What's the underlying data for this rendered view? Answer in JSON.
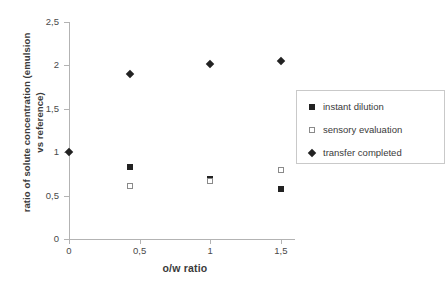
{
  "chart_data": {
    "type": "scatter",
    "title": "",
    "xlabel": "o/w ratio",
    "ylabel": "ratio of solute concentration (emulsion vs reference)",
    "ylabel_line1": "ratio of solute concentration (emulsion",
    "ylabel_line2": "vs reference)",
    "xlim": [
      0,
      1.6
    ],
    "ylim": [
      0,
      2.5
    ],
    "grid": false,
    "legend_position": "right",
    "xticks": [
      0,
      0.5,
      1,
      1.5
    ],
    "xtick_labels": [
      "0",
      "0,5",
      "1",
      "1,5"
    ],
    "yticks": [
      0,
      0.5,
      1,
      1.5,
      2,
      2.5
    ],
    "ytick_labels": [
      "0",
      "0,5",
      "1",
      "1,5",
      "2",
      "2,5"
    ],
    "series": [
      {
        "name": "instant dilution",
        "marker": "filled-square",
        "color": "#222222",
        "points": [
          {
            "x": 0.43,
            "y": 0.83
          },
          {
            "x": 1.0,
            "y": 0.69
          },
          {
            "x": 1.5,
            "y": 0.58
          }
        ]
      },
      {
        "name": "sensory evaluation",
        "marker": "open-square",
        "color": "#8a8a8a",
        "points": [
          {
            "x": 0.43,
            "y": 0.61
          },
          {
            "x": 1.0,
            "y": 0.67
          },
          {
            "x": 1.5,
            "y": 0.79
          }
        ]
      },
      {
        "name": "transfer completed",
        "marker": "filled-diamond",
        "color": "#222222",
        "points": [
          {
            "x": 0.0,
            "y": 1.0
          },
          {
            "x": 0.43,
            "y": 1.9
          },
          {
            "x": 1.0,
            "y": 2.02
          },
          {
            "x": 1.5,
            "y": 2.05
          }
        ]
      }
    ]
  },
  "legend": {
    "items": [
      {
        "label": "instant dilution",
        "marker": "filled-square"
      },
      {
        "label": "sensory evaluation",
        "marker": "open-square"
      },
      {
        "label": "transfer completed",
        "marker": "filled-diamond"
      }
    ]
  },
  "colors": {
    "axis": "#b3b3b3",
    "text": "#3a3a3a",
    "marker_dark": "#222222",
    "marker_open_border": "#8a8a8a",
    "legend_border": "#c9c9c9",
    "background": "#ffffff"
  }
}
